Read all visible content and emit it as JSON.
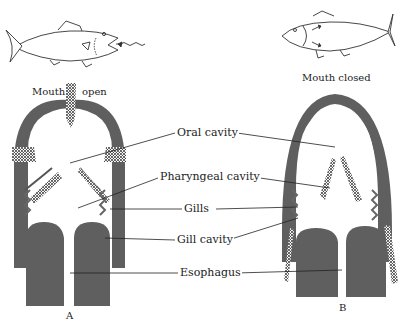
{
  "diagram": {
    "panels": [
      {
        "id": "A",
        "letter": "A",
        "caption_left": "Mouth",
        "caption_right": "open",
        "state": "Mouth open"
      },
      {
        "id": "B",
        "letter": "B",
        "caption": "Mouth closed"
      }
    ],
    "labels": [
      {
        "key": "oral",
        "text": "Oral cavity"
      },
      {
        "key": "pharyngeal",
        "text": "Pharyngeal cavity"
      },
      {
        "key": "gills",
        "text": "Gills"
      },
      {
        "key": "gill_cavity",
        "text": "Gill cavity"
      },
      {
        "key": "esophagus",
        "text": "Esophagus"
      }
    ],
    "colors": {
      "tissue": "#5f5f5f",
      "line": "#222222",
      "background": "#ffffff"
    }
  }
}
